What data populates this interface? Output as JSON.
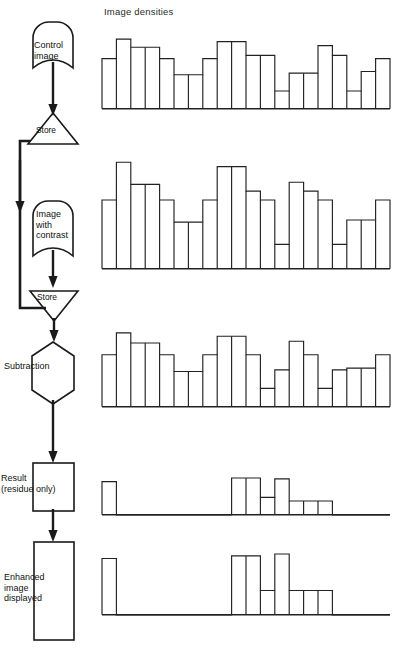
{
  "diagram": {
    "title": "Image densities",
    "type": "flowchart-with-histograms"
  },
  "flow": {
    "nodes": [
      {
        "id": "control-image",
        "label": "Control\nimage",
        "shape": "stored-data",
        "label_x": 36,
        "label_y": 40
      },
      {
        "id": "store-1",
        "label": "Store",
        "shape": "triangle-up",
        "label_x": 38,
        "label_y": 127
      },
      {
        "id": "image-contrast",
        "label": "Image\nwith\ncontrast",
        "shape": "stored-data",
        "label_x": 36,
        "label_y": 210
      },
      {
        "id": "store-2",
        "label": "Store",
        "shape": "triangle-down",
        "label_x": 38,
        "label_y": 295
      },
      {
        "id": "subtraction",
        "label": "Subtraction",
        "shape": "hexagon",
        "label_x": 5,
        "label_y": 362
      },
      {
        "id": "result",
        "label": "Result\n(residue only)",
        "shape": "rectangle",
        "label_x": 2,
        "label_y": 473
      },
      {
        "id": "enhanced",
        "label": "Enhanced\nimage\ndisplayed",
        "shape": "rectangle",
        "label_x": 4,
        "label_y": 572
      }
    ],
    "connectors": [
      {
        "from": "control-image",
        "to": "store-1",
        "kind": "arrow-down"
      },
      {
        "from": "store-1",
        "to": "subtraction",
        "kind": "bus-left-down"
      },
      {
        "from": "store-1",
        "to": "image-contrast",
        "kind": "arrow-down"
      },
      {
        "from": "image-contrast",
        "to": "store-2",
        "kind": "arrow-down"
      },
      {
        "from": "store-2",
        "to": "subtraction",
        "kind": "arrow-down"
      },
      {
        "from": "subtraction",
        "to": "result",
        "kind": "arrow-down"
      },
      {
        "from": "result",
        "to": "enhanced",
        "kind": "arrow-down"
      }
    ]
  },
  "chart_data": [
    {
      "id": "hist-control-image",
      "type": "bar",
      "title": "Control image densities",
      "caption_stage": "Control image",
      "xlabel": "",
      "ylabel": "Density",
      "grid": false,
      "legend": "none",
      "axis_line": "bottom",
      "ylim": [
        0,
        100
      ],
      "categories": [
        "1",
        "2",
        "3",
        "4",
        "5",
        "6",
        "7",
        "8",
        "9",
        "10",
        "11",
        "12",
        "13",
        "14",
        "15",
        "16",
        "17",
        "18",
        "19",
        "20"
      ],
      "values": [
        62,
        86,
        76,
        76,
        62,
        42,
        42,
        62,
        83,
        83,
        66,
        66,
        22,
        44,
        44,
        78,
        66,
        22,
        46,
        62
      ]
    },
    {
      "id": "hist-image-with-contrast",
      "type": "bar",
      "title": "Image with contrast densities",
      "caption_stage": "Image with contrast",
      "xlabel": "",
      "ylabel": "Density",
      "grid": false,
      "legend": "none",
      "axis_line": "bottom",
      "ylim": [
        0,
        100
      ],
      "categories": [
        "1",
        "2",
        "3",
        "4",
        "5",
        "6",
        "7",
        "8",
        "9",
        "10",
        "11",
        "12",
        "13",
        "14",
        "15",
        "16",
        "17",
        "18",
        "19",
        "20"
      ],
      "values": [
        62,
        96,
        76,
        76,
        62,
        42,
        42,
        62,
        92,
        92,
        70,
        62,
        22,
        78,
        70,
        62,
        22,
        44,
        44,
        62
      ]
    },
    {
      "id": "hist-subtraction",
      "type": "bar",
      "title": "Subtraction input densities",
      "caption_stage": "Subtraction",
      "xlabel": "",
      "ylabel": "Density",
      "grid": false,
      "legend": "none",
      "axis_line": "bottom",
      "ylim": [
        0,
        100
      ],
      "categories": [
        "1",
        "2",
        "3",
        "4",
        "5",
        "6",
        "7",
        "8",
        "9",
        "10",
        "11",
        "12",
        "13",
        "14",
        "15",
        "16",
        "17",
        "18",
        "19",
        "20"
      ],
      "values": [
        62,
        88,
        76,
        76,
        62,
        42,
        42,
        62,
        84,
        84,
        62,
        22,
        44,
        78,
        62,
        22,
        44,
        46,
        46,
        62
      ]
    },
    {
      "id": "hist-result-residue",
      "type": "bar",
      "title": "Result (residue only)",
      "caption_stage": "Result (residue only)",
      "xlabel": "",
      "ylabel": "Residue",
      "grid": false,
      "legend": "none",
      "axis_line": "bottom",
      "ylim": [
        0,
        100
      ],
      "categories": [
        "1",
        "2",
        "3",
        "4",
        "5",
        "6",
        "7",
        "8",
        "9",
        "10",
        "11",
        "12",
        "13",
        "14",
        "15",
        "16",
        "17",
        "18",
        "19",
        "20"
      ],
      "values": [
        72,
        0,
        0,
        0,
        0,
        0,
        0,
        0,
        0,
        80,
        80,
        38,
        78,
        30,
        30,
        30,
        0,
        0,
        0,
        0
      ]
    },
    {
      "id": "hist-enhanced-displayed",
      "type": "bar",
      "title": "Enhanced image displayed",
      "caption_stage": "Enhanced image displayed",
      "xlabel": "",
      "ylabel": "Enhanced density",
      "grid": false,
      "legend": "none",
      "axis_line": "bottom",
      "ylim": [
        0,
        100
      ],
      "categories": [
        "1",
        "2",
        "3",
        "4",
        "5",
        "6",
        "7",
        "8",
        "9",
        "10",
        "11",
        "12",
        "13",
        "14",
        "15",
        "16",
        "17",
        "18",
        "19",
        "20"
      ],
      "values": [
        88,
        0,
        0,
        0,
        0,
        0,
        0,
        0,
        0,
        92,
        92,
        38,
        95,
        38,
        38,
        38,
        0,
        0,
        0,
        0
      ]
    }
  ],
  "colors": {
    "ink": "#1a1a1a",
    "stroke": "#222222",
    "background": "#ffffff"
  }
}
